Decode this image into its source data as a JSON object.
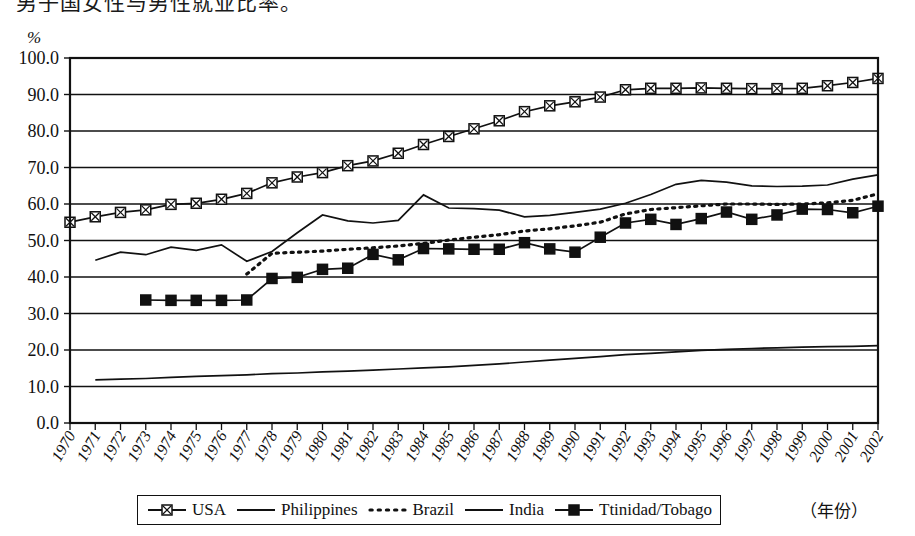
{
  "caption": {
    "top_text_clipped": "男子国女性与男性就业比率。"
  },
  "axis": {
    "unit_label": "%",
    "x_axis_label": "（年份）",
    "y_ticks": [
      "0.0",
      "10.0",
      "20.0",
      "30.0",
      "40.0",
      "50.0",
      "60.0",
      "70.0",
      "80.0",
      "90.0",
      "100.0"
    ]
  },
  "legend": {
    "items": [
      {
        "label": "USA",
        "marker": "square-crossed",
        "style": "solid",
        "color": "#111111"
      },
      {
        "label": "Philippines",
        "marker": "none",
        "style": "solid",
        "color": "#111111"
      },
      {
        "label": "Brazil",
        "marker": "none",
        "style": "dotted",
        "color": "#111111"
      },
      {
        "label": "India",
        "marker": "none",
        "style": "solid",
        "color": "#111111"
      },
      {
        "label": "Ttinidad/Tobago",
        "marker": "square-filled",
        "style": "solid",
        "color": "#111111"
      }
    ]
  },
  "chart_data": {
    "type": "line",
    "title": "",
    "xlabel": "（年份）",
    "ylabel": "%",
    "ylim": [
      0,
      100
    ],
    "ytick_step": 10,
    "grid": true,
    "legend_position": "bottom",
    "x": [
      1970,
      1971,
      1972,
      1973,
      1974,
      1975,
      1976,
      1977,
      1978,
      1979,
      1980,
      1981,
      1982,
      1983,
      1984,
      1985,
      1986,
      1987,
      1988,
      1989,
      1990,
      1991,
      1992,
      1993,
      1994,
      1995,
      1996,
      1997,
      1998,
      1999,
      2000,
      2001,
      2002
    ],
    "categories": [
      "1970",
      "1971",
      "1972",
      "1973",
      "1974",
      "1975",
      "1976",
      "1977",
      "1978",
      "1979",
      "1980",
      "1981",
      "1982",
      "1983",
      "1984",
      "1985",
      "1986",
      "1987",
      "1988",
      "1989",
      "1990",
      "1991",
      "1992",
      "1993",
      "1994",
      "1995",
      "1996",
      "1997",
      "1998",
      "1999",
      "2000",
      "2001",
      "2002"
    ],
    "series": [
      {
        "name": "USA",
        "marker": "square-crossed",
        "style": "solid",
        "values": [
          55.0,
          56.5,
          57.7,
          58.4,
          59.9,
          60.2,
          61.3,
          62.9,
          65.8,
          67.4,
          68.6,
          70.5,
          71.8,
          73.9,
          76.3,
          78.5,
          80.6,
          82.8,
          85.3,
          86.9,
          88.0,
          89.3,
          91.3,
          91.7,
          91.7,
          91.8,
          91.7,
          91.6,
          91.6,
          91.7,
          92.4,
          93.3,
          94.4
        ]
      },
      {
        "name": "Philippines",
        "marker": "none",
        "style": "solid",
        "values": [
          null,
          44.6,
          46.8,
          46.1,
          48.2,
          47.3,
          48.8,
          44.3,
          47.0,
          52.1,
          57.0,
          55.4,
          54.8,
          55.5,
          62.5,
          58.9,
          58.7,
          58.3,
          56.5,
          56.9,
          57.7,
          58.6,
          60.2,
          62.6,
          65.4,
          66.5,
          66.0,
          65.0,
          64.8,
          64.9,
          65.2,
          66.8,
          68.0
        ]
      },
      {
        "name": "Brazil",
        "marker": "none",
        "style": "dotted",
        "values": [
          null,
          null,
          null,
          null,
          null,
          null,
          null,
          40.8,
          46.5,
          46.8,
          47.1,
          47.6,
          48.0,
          48.5,
          49.2,
          50.1,
          50.9,
          51.6,
          52.6,
          53.2,
          54.0,
          55.0,
          57.3,
          58.5,
          59.0,
          59.5,
          60.0,
          60.0,
          59.9,
          60.0,
          60.3,
          61.0,
          62.8
        ]
      },
      {
        "name": "India",
        "marker": "none",
        "style": "solid",
        "values": [
          null,
          11.8,
          12.0,
          12.2,
          12.5,
          12.8,
          13.0,
          13.2,
          13.5,
          13.7,
          14.0,
          14.2,
          14.5,
          14.8,
          15.1,
          15.4,
          15.8,
          16.2,
          16.7,
          17.2,
          17.7,
          18.2,
          18.7,
          19.1,
          19.5,
          19.9,
          20.2,
          20.4,
          20.6,
          20.8,
          20.9,
          21.0,
          21.2
        ]
      },
      {
        "name": "Ttinidad/Tobago",
        "marker": "square-filled",
        "style": "solid",
        "values": [
          null,
          null,
          null,
          33.7,
          33.6,
          33.6,
          33.6,
          33.7,
          39.6,
          39.9,
          42.1,
          42.4,
          46.2,
          44.7,
          47.8,
          47.7,
          47.6,
          47.6,
          49.4,
          47.7,
          46.8,
          50.9,
          54.8,
          55.8,
          54.4,
          56.0,
          57.8,
          55.8,
          57.0,
          58.6,
          58.5,
          57.6,
          59.4
        ]
      }
    ]
  }
}
